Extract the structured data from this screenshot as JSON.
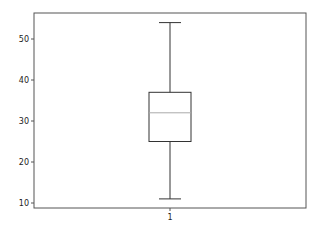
{
  "chart_data": {
    "type": "box",
    "title": "",
    "xlabel": "",
    "ylabel": "",
    "categories": [
      "1"
    ],
    "series": [
      {
        "name": "1",
        "whisker_low": 11,
        "q1": 25,
        "median": 32,
        "q3": 37,
        "whisker_high": 54
      }
    ],
    "ylim": [
      9,
      56
    ],
    "yticks": [
      10,
      20,
      30,
      40,
      50
    ],
    "xticks": [
      "1"
    ],
    "grid": false,
    "legend": null
  },
  "style": {
    "axis_color": "#555555",
    "box_color": "#333333",
    "median_color": "#aaaaaa",
    "background": "#ffffff"
  }
}
